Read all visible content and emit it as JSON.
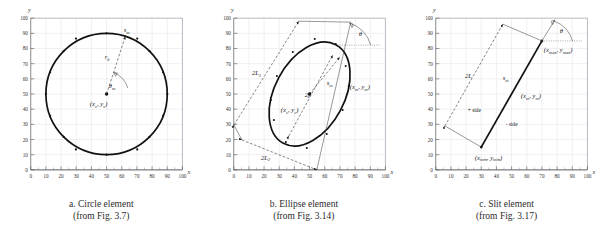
{
  "figure": {
    "axis": {
      "x_label": "x",
      "y_label": "y",
      "ticks": [
        "0",
        "10",
        "20",
        "30",
        "40",
        "50",
        "60",
        "70",
        "80",
        "90",
        "100"
      ],
      "range": [
        0,
        100
      ],
      "step": 10
    },
    "panels": [
      {
        "id": "circle",
        "caption_line1": "a. Circle element",
        "caption_line2": "(from Fig. 3.7)",
        "labels": {
          "arc_point": "s",
          "arc_point_sub": "m",
          "radius": "r",
          "radius_sub": "b",
          "angle": "θ",
          "angle_sub": "m",
          "center": "(x",
          "center_sub1": "c",
          "center_mid": ", y",
          "center_sub2": "c",
          "center_end": ")"
        },
        "geometry": {
          "center": [
            50,
            50
          ],
          "radius": 40,
          "point_angle_deg": 72
        }
      },
      {
        "id": "ellipse",
        "caption_line1": "b. Ellipse element",
        "caption_line2": "(from Fig. 3.14)",
        "labels": {
          "major_axis": "2L",
          "major_axis_sub": "1",
          "minor_axis": "2L",
          "minor_axis_sub": "2",
          "focal": "2f",
          "arc_point": "s",
          "arc_point_sub": "m",
          "point_coord": "(x",
          "point_sub1": "m",
          "point_mid": ", y",
          "point_sub2": "m",
          "point_end": ")",
          "center": "(x",
          "center_sub1": "c",
          "center_mid": ", y",
          "center_sub2": "c",
          "center_end": ")",
          "angle": "θ"
        },
        "geometry": {
          "center": [
            50,
            50
          ],
          "semi_major": 37,
          "semi_minor": 23,
          "tilt_deg": 62
        }
      },
      {
        "id": "slit",
        "caption_line1": "c. Slit element",
        "caption_line2": "(from Fig. 3.17)",
        "labels": {
          "length": "2L",
          "arc_point": "s",
          "arc_point_sub": "m",
          "point_coord": "(x",
          "point_sub1": "m",
          "point_mid": ", y",
          "point_sub2": "m",
          "point_end": ")",
          "max_coord": "(x",
          "max_sub1": "max",
          "max_mid": ", y",
          "max_sub2": "max",
          "max_end": ")",
          "min_coord": "(x",
          "min_sub1": "min",
          "min_mid": ", y",
          "min_sub2": "min",
          "min_end": ")",
          "plus_side": "+ side",
          "minus_side": "- side",
          "angle": "θ"
        },
        "geometry": {
          "min_point": [
            30,
            15
          ],
          "max_point": [
            70,
            85
          ],
          "tilt_deg": 60
        }
      }
    ]
  }
}
